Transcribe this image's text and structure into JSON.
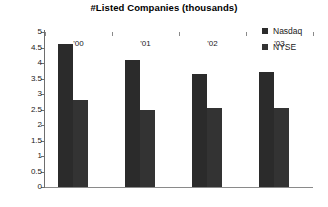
{
  "chart_data": {
    "type": "bar",
    "title": "#Listed Companies (thousands)",
    "xlabel": "",
    "ylabel": "",
    "categories": [
      "'00",
      "'01",
      "'02",
      "'03"
    ],
    "series": [
      {
        "name": "Nasdaq",
        "color": "#2b2b2b",
        "values": [
          4.6,
          4.1,
          3.65,
          3.7
        ]
      },
      {
        "name": "NYSE",
        "color": "#333333",
        "values": [
          2.8,
          2.5,
          2.55,
          2.55
        ]
      }
    ],
    "ylim": [
      0,
      5
    ],
    "ytick_step": 0.5,
    "yticks": [
      "5",
      "4.5",
      "4",
      "3.5",
      "3",
      "2.5",
      "2",
      "1.5",
      "1",
      "0.5",
      "0"
    ],
    "grid": false,
    "legend_position": "top-right",
    "axis_color": "#6e6e6e"
  }
}
